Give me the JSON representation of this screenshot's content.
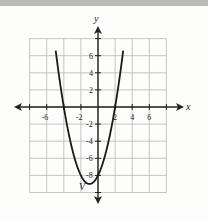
{
  "chart_data": {
    "type": "line",
    "title": "",
    "xlabel": "x",
    "ylabel": "y",
    "xlim": [
      -8,
      8
    ],
    "ylim": [
      -10,
      8
    ],
    "grid": true,
    "grid_step": 2,
    "x_ticks": [
      -6,
      -2,
      2,
      4,
      6
    ],
    "y_ticks": [
      6,
      4,
      2,
      -2,
      -4,
      -6,
      -8
    ],
    "series": [
      {
        "name": "parabola",
        "equation": "y = x^2 + 2x - 8",
        "x": [
          -4.9,
          -4.5,
          -4,
          -3,
          -2,
          -1,
          0,
          1,
          2,
          2.5,
          2.9
        ],
        "values": [
          7.2,
          3.25,
          0,
          -5,
          -8,
          -9,
          -8,
          -5,
          0,
          3.25,
          7.2
        ]
      }
    ],
    "annotations": [
      {
        "text": "V",
        "x": -1.6,
        "y": -9.7,
        "note": "vertex label"
      }
    ]
  },
  "labels": {
    "x_axis": "x",
    "y_axis": "y",
    "vertex": "V",
    "xticks": [
      "-6",
      "-2",
      "2",
      "4",
      "6"
    ],
    "yticks": [
      "6",
      "4",
      "2",
      "-2",
      "-4",
      "-6",
      "-8"
    ]
  }
}
